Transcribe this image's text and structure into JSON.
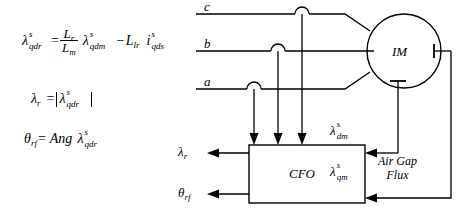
{
  "diagram": {
    "equations": {
      "eq1": {
        "lhs_sym": "λ",
        "lhs_sup": "s",
        "lhs_sub": "qdr",
        "equals": "=",
        "frac_num": "L",
        "frac_num_sub": "r",
        "frac_den": "L",
        "frac_den_sub": "m",
        "t2_sym": "λ",
        "t2_sup": "s",
        "t2_sub": "qdm",
        "minus": "−",
        "t3_sym": "L",
        "t3_sub": "lr",
        "t4_sym": "i",
        "t4_sup": "s",
        "t4_sub": "qds"
      },
      "eq2": {
        "lhs_sym": "λ",
        "lhs_sub": "r",
        "equals": "=",
        "arg_sym": "λ",
        "arg_sup": "s",
        "arg_sub": "qdr"
      },
      "eq3": {
        "lhs_sym": "θ",
        "lhs_sub": "rf",
        "equals": "=",
        "operator": "Ang",
        "arg_sym": "λ",
        "arg_sup": "s",
        "arg_sub": "qdr"
      }
    },
    "phase_lines": [
      {
        "label": "c"
      },
      {
        "label": "b"
      },
      {
        "label": "a"
      }
    ],
    "motor": {
      "label": "IM"
    },
    "observer": {
      "label": "CFO"
    },
    "flux_inputs": [
      {
        "sym": "λ",
        "sup": "s",
        "sub": "dm"
      },
      {
        "sym": "λ",
        "sup": "s",
        "sub": "qm"
      }
    ],
    "flux_annotation": {
      "line1": "Air Gap",
      "line2": "Flux"
    },
    "outputs": [
      {
        "sym": "λ",
        "sub": "r"
      },
      {
        "sym": "θ",
        "sub": "rf"
      }
    ],
    "colors": {
      "ink": "#000000",
      "background": "#ffffff"
    }
  }
}
